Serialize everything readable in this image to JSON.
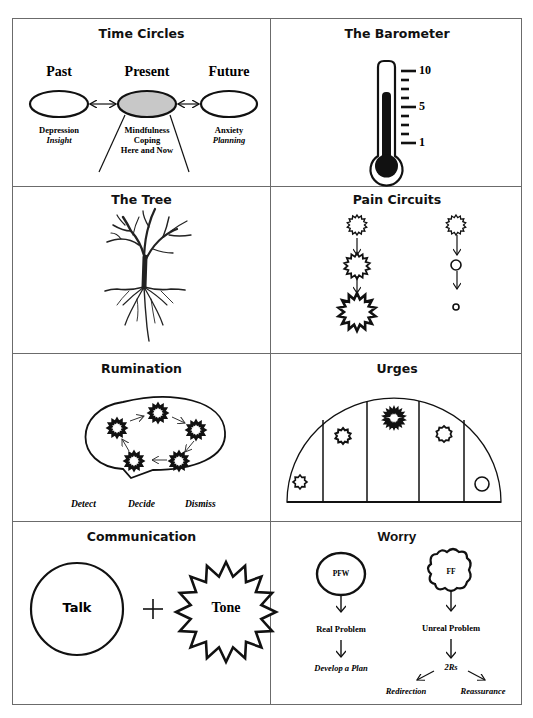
{
  "panels": {
    "time_circles": {
      "title": "Time Circles",
      "past": {
        "label": "Past",
        "line1": "Depression",
        "line2": "Insight"
      },
      "present": {
        "label": "Present",
        "line1": "Mindfulness",
        "line2": "Coping",
        "line3": "Here and Now",
        "fill": "#c8c8c8"
      },
      "future": {
        "label": "Future",
        "line1": "Anxiety",
        "line2": "Planning"
      }
    },
    "barometer": {
      "title": "The Barometer",
      "scale_labels": {
        "top": "10",
        "mid": "5",
        "bottom": "1"
      },
      "level": 7
    },
    "tree": {
      "title": "The Tree"
    },
    "pain_circuits": {
      "title": "Pain Circuits"
    },
    "rumination": {
      "title": "Rumination",
      "steps": [
        "Detect",
        "Decide",
        "Dismiss"
      ]
    },
    "urges": {
      "title": "Urges"
    },
    "communication": {
      "title": "Communication",
      "left": "Talk",
      "operator": "+",
      "right": "Tone"
    },
    "worry": {
      "title": "Worry",
      "left": {
        "bubble": "PFW",
        "type": "Real Problem",
        "action": "Develop a Plan"
      },
      "right": {
        "bubble": "FF",
        "type": "Unreal Problem",
        "action": "2Rs",
        "option1": "Redirection",
        "option2": "Reassurance"
      }
    }
  }
}
